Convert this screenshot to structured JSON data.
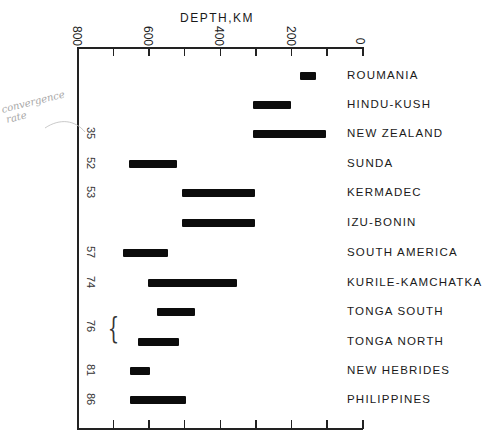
{
  "chart_data": {
    "type": "bar",
    "subtype": "horizontal-range",
    "title": "",
    "xlabel": "DEPTH, KM",
    "ylabel": "",
    "xlim": [
      800,
      0
    ],
    "x_ticks": [
      800,
      600,
      400,
      200,
      0
    ],
    "x_minor_step": 100,
    "grid": false,
    "legend": null,
    "categories": [
      "ROUMANIA",
      "HINDU-KUSH",
      "NEW ZEALAND",
      "SUNDA",
      "KERMADEC",
      "IZU-BONIN",
      "SOUTH AMERICA",
      "KURILE-KAMCHATKA",
      "TONGA SOUTH",
      "TONGA NORTH",
      "NEW HEBRIDES",
      "PHILIPPINES"
    ],
    "series": [
      {
        "name": "depth_range_km",
        "values": [
          [
            130,
            175
          ],
          [
            200,
            305
          ],
          [
            100,
            305
          ],
          [
            520,
            655
          ],
          [
            300,
            505
          ],
          [
            300,
            505
          ],
          [
            545,
            670
          ],
          [
            350,
            600
          ],
          [
            470,
            575
          ],
          [
            515,
            630
          ],
          [
            595,
            650
          ],
          [
            495,
            650
          ]
        ]
      }
    ],
    "left_annotations": [
      {
        "row": "SUNDA",
        "text": "35"
      },
      {
        "row": "KERMADEC",
        "text": "52"
      },
      {
        "row": "IZU-BONIN",
        "text": "53"
      },
      {
        "row": "SOUTH AMERICA",
        "text": "57"
      },
      {
        "row": "KURILE-KAMCHATKA",
        "text": "74"
      },
      {
        "row": "TONGA SOUTH / TONGA NORTH",
        "text": "76"
      },
      {
        "row": "NEW HEBRIDES",
        "text": "81"
      },
      {
        "row": "PHILIPPINES",
        "text": "86"
      }
    ],
    "handwritten_note": "convergence rate"
  },
  "axis": {
    "title": "DEPTH,KM",
    "ticks": [
      "800",
      "600",
      "400",
      "200",
      "0"
    ]
  },
  "rows": [
    {
      "label": "ROUMANIA",
      "rate": "",
      "from": 130,
      "to": 175
    },
    {
      "label": "HINDU-KUSH",
      "rate": "",
      "from": 200,
      "to": 305
    },
    {
      "label": "NEW ZEALAND",
      "rate": "35",
      "from": 100,
      "to": 305
    },
    {
      "label": "SUNDA",
      "rate": "52",
      "from": 520,
      "to": 655
    },
    {
      "label": "KERMADEC",
      "rate": "53",
      "from": 300,
      "to": 505
    },
    {
      "label": "IZU-BONIN",
      "rate": "",
      "from": 300,
      "to": 505
    },
    {
      "label": "SOUTH AMERICA",
      "rate": "57",
      "from": 545,
      "to": 670
    },
    {
      "label": "KURILE-KAMCHATKA",
      "rate": "74",
      "from": 350,
      "to": 600
    },
    {
      "label": "TONGA SOUTH",
      "rate": "",
      "from": 470,
      "to": 575
    },
    {
      "label": "TONGA NORTH",
      "rate": "",
      "from": 515,
      "to": 630
    },
    {
      "label": "NEW HEBRIDES",
      "rate": "81",
      "from": 595,
      "to": 650
    },
    {
      "label": "PHILIPPINES",
      "rate": "86",
      "from": 495,
      "to": 650
    }
  ],
  "tonga_rate": "76",
  "note": {
    "line1": "convergence",
    "line2": "rate"
  }
}
